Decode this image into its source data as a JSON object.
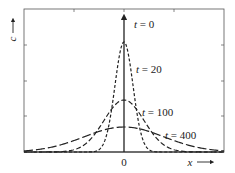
{
  "figure": {
    "type": "diffusion profile diagram",
    "y_axis_label": "c",
    "x_axis_label": "x",
    "origin_label": "0",
    "plot_frame": {
      "left": 24,
      "right": 224,
      "top": 9,
      "baseline": 152
    },
    "frame_ticks": {
      "top_x": [
        74,
        124,
        174
      ],
      "side_y": [
        45,
        81,
        116
      ]
    },
    "curves": [
      {
        "id": "t0",
        "label_var": "t",
        "label_value": "0",
        "label_text": "t = 0",
        "style": "solid-arrow",
        "peak_y": 13,
        "sigma": 0,
        "label_pos": [
          134,
          28
        ]
      },
      {
        "id": "t20",
        "label_var": "t",
        "label_value": "20",
        "label_text": "t = 20",
        "style": "short-dash",
        "peak_y": 42,
        "sigma": 9,
        "label_pos": [
          136,
          73
        ]
      },
      {
        "id": "t100",
        "label_var": "t",
        "label_value": "100",
        "label_text": "t = 100",
        "style": "medium-dash",
        "peak_y": 100,
        "sigma": 20,
        "label_pos": [
          142,
          116
        ]
      },
      {
        "id": "t400",
        "label_var": "t",
        "label_value": "400",
        "label_text": "t = 400",
        "style": "long-dash",
        "peak_y": 127,
        "sigma": 40,
        "label_pos": [
          165,
          139
        ]
      }
    ],
    "colors": {
      "line": "#222222",
      "frame": "#555555",
      "background": "#ffffff"
    }
  }
}
